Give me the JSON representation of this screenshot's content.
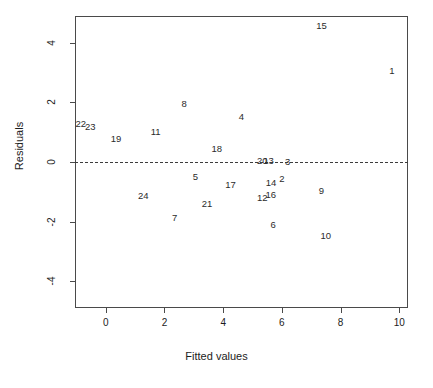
{
  "chart_data": {
    "type": "scatter",
    "title": "",
    "xlabel": "Fitted values",
    "ylabel": "Residuals",
    "xlim": [
      -1.05,
      10.3
    ],
    "ylim": [
      -4.9,
      4.9
    ],
    "xticks": [
      0,
      2,
      4,
      6,
      8,
      10
    ],
    "xtick_labels": [
      "0",
      "2",
      "4",
      "6",
      "8",
      "10"
    ],
    "yticks": [
      4,
      2,
      0,
      -2,
      -4
    ],
    "ytick_labels": [
      "4",
      "2",
      "0",
      "-2",
      "-4"
    ],
    "grid": false,
    "legend": false,
    "marker_style": "text-labels",
    "reference_line": {
      "type": "horizontal-dashed",
      "y": 0
    },
    "points": [
      {
        "label": "15",
        "x": 7.35,
        "y": 4.55
      },
      {
        "label": "1",
        "x": 9.75,
        "y": 3.05
      },
      {
        "label": "8",
        "x": 2.67,
        "y": 1.95
      },
      {
        "label": "4",
        "x": 4.62,
        "y": 1.5
      },
      {
        "label": "22",
        "x": -0.85,
        "y": 1.27
      },
      {
        "label": "23",
        "x": -0.53,
        "y": 1.17
      },
      {
        "label": "11",
        "x": 1.7,
        "y": 1.02
      },
      {
        "label": "19",
        "x": 0.35,
        "y": 0.78
      },
      {
        "label": "18",
        "x": 3.78,
        "y": 0.43
      },
      {
        "label": "20",
        "x": 5.33,
        "y": 0.03
      },
      {
        "label": "13",
        "x": 5.55,
        "y": 0.02
      },
      {
        "label": "3",
        "x": 6.2,
        "y": 0.0
      },
      {
        "label": "5",
        "x": 3.05,
        "y": -0.52
      },
      {
        "label": "2",
        "x": 6.0,
        "y": -0.57
      },
      {
        "label": "14",
        "x": 5.63,
        "y": -0.72
      },
      {
        "label": "17",
        "x": 4.25,
        "y": -0.77
      },
      {
        "label": "9",
        "x": 7.35,
        "y": -0.98
      },
      {
        "label": "16",
        "x": 5.62,
        "y": -1.1
      },
      {
        "label": "12",
        "x": 5.33,
        "y": -1.2
      },
      {
        "label": "24",
        "x": 1.28,
        "y": -1.13
      },
      {
        "label": "21",
        "x": 3.45,
        "y": -1.4
      },
      {
        "label": "7",
        "x": 2.35,
        "y": -1.88
      },
      {
        "label": "6",
        "x": 5.7,
        "y": -2.12
      },
      {
        "label": "10",
        "x": 7.5,
        "y": -2.48
      }
    ]
  }
}
